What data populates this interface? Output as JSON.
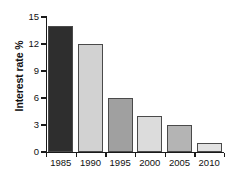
{
  "chart_data": {
    "type": "bar",
    "title": "",
    "xlabel": "",
    "ylabel": "Interest rate %",
    "categories": [
      "1985",
      "1990",
      "1995",
      "2000",
      "2005",
      "2010"
    ],
    "values": [
      14,
      12,
      6,
      4,
      3,
      1
    ],
    "bar_colors": [
      "#2e2e2e",
      "#d2d2d2",
      "#a0a0a0",
      "#dcdcdc",
      "#b4b4b4",
      "#e2e2e2"
    ],
    "bar_border_color": "#4a4a4a",
    "ylim": [
      0,
      15
    ],
    "ytick_values": [
      0,
      3,
      6,
      9,
      12,
      15
    ],
    "ytick_labels": [
      "0",
      "3",
      "6",
      "9",
      "12",
      "15"
    ],
    "xtick_labels": [
      "1985",
      "1990",
      "1995",
      "2000",
      "2005",
      "2010"
    ],
    "grid": false,
    "legend": "none",
    "axis_color": "#1a1a1a",
    "background": "#ffffff"
  }
}
